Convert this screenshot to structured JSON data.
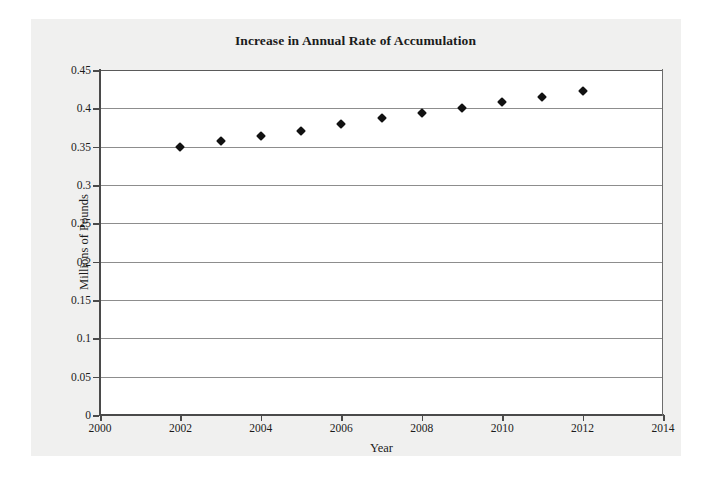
{
  "chart_data": {
    "type": "scatter",
    "title": "Increase in Annual Rate of Accumulation",
    "xlabel": "Year",
    "ylabel": "Millions of Pounds",
    "xlim": [
      2000,
      2014
    ],
    "ylim": [
      0,
      0.45
    ],
    "xticks": [
      2000,
      2002,
      2004,
      2006,
      2008,
      2010,
      2012,
      2014
    ],
    "xtick_labels": [
      "2000",
      "2002",
      "2004",
      "2006",
      "2008",
      "2010",
      "2012",
      "2014"
    ],
    "yticks": [
      0,
      0.05,
      0.1,
      0.15,
      0.2,
      0.25,
      0.3,
      0.35,
      0.4,
      0.45
    ],
    "ytick_labels": [
      "0",
      "0.05",
      "0.1",
      "0.15",
      "0.2",
      "0.25",
      "0.3",
      "0.35",
      "0.4",
      "0.45"
    ],
    "grid": "horizontal",
    "legend": "none",
    "marker": "diamond",
    "marker_color": "#111111",
    "x": [
      2002,
      2003,
      2004,
      2005,
      2006,
      2007,
      2008,
      2009,
      2010,
      2011,
      2012
    ],
    "values": [
      0.35,
      0.357,
      0.364,
      0.371,
      0.379,
      0.387,
      0.394,
      0.401,
      0.408,
      0.415,
      0.422
    ],
    "series": [
      {
        "name": "Annual Rate of Accumulation",
        "values": [
          0.35,
          0.357,
          0.364,
          0.371,
          0.379,
          0.387,
          0.394,
          0.401,
          0.408,
          0.415,
          0.422
        ]
      }
    ]
  },
  "colors": {
    "page_background": "#ffffff",
    "panel_background": "#f0f0ef",
    "plot_background": "#ffffff",
    "axis": "#4a4a4a",
    "gridline": "#8d8d8d",
    "text": "#1b1b1b",
    "marker": "#111111"
  }
}
